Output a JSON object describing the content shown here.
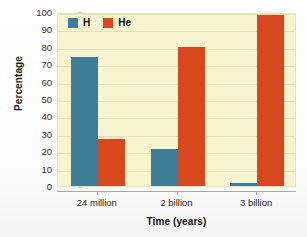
{
  "chart_data": {
    "type": "bar",
    "title": "",
    "xlabel": "Time (years)",
    "ylabel": "Percentage",
    "categories": [
      "24 million",
      "2 billion",
      "3 billion"
    ],
    "series": [
      {
        "name": "H",
        "color": "#3d7d9a",
        "values": [
          74,
          21,
          2
        ]
      },
      {
        "name": "He",
        "color": "#d9481c",
        "values": [
          27,
          80,
          98
        ]
      }
    ],
    "ylim": [
      0,
      100
    ],
    "ytick_step": 10,
    "yticks": [
      0,
      10,
      20,
      30,
      40,
      50,
      60,
      70,
      80,
      90,
      100
    ],
    "grid": true,
    "grid_axis": "y",
    "legend_position": "top-left",
    "plot_background": "#f7f4cf",
    "page_background": "#fdfdfd"
  },
  "legend": {
    "items": [
      {
        "label": "H",
        "color": "#3d7d9a"
      },
      {
        "label": "He",
        "color": "#d9481c"
      }
    ]
  }
}
